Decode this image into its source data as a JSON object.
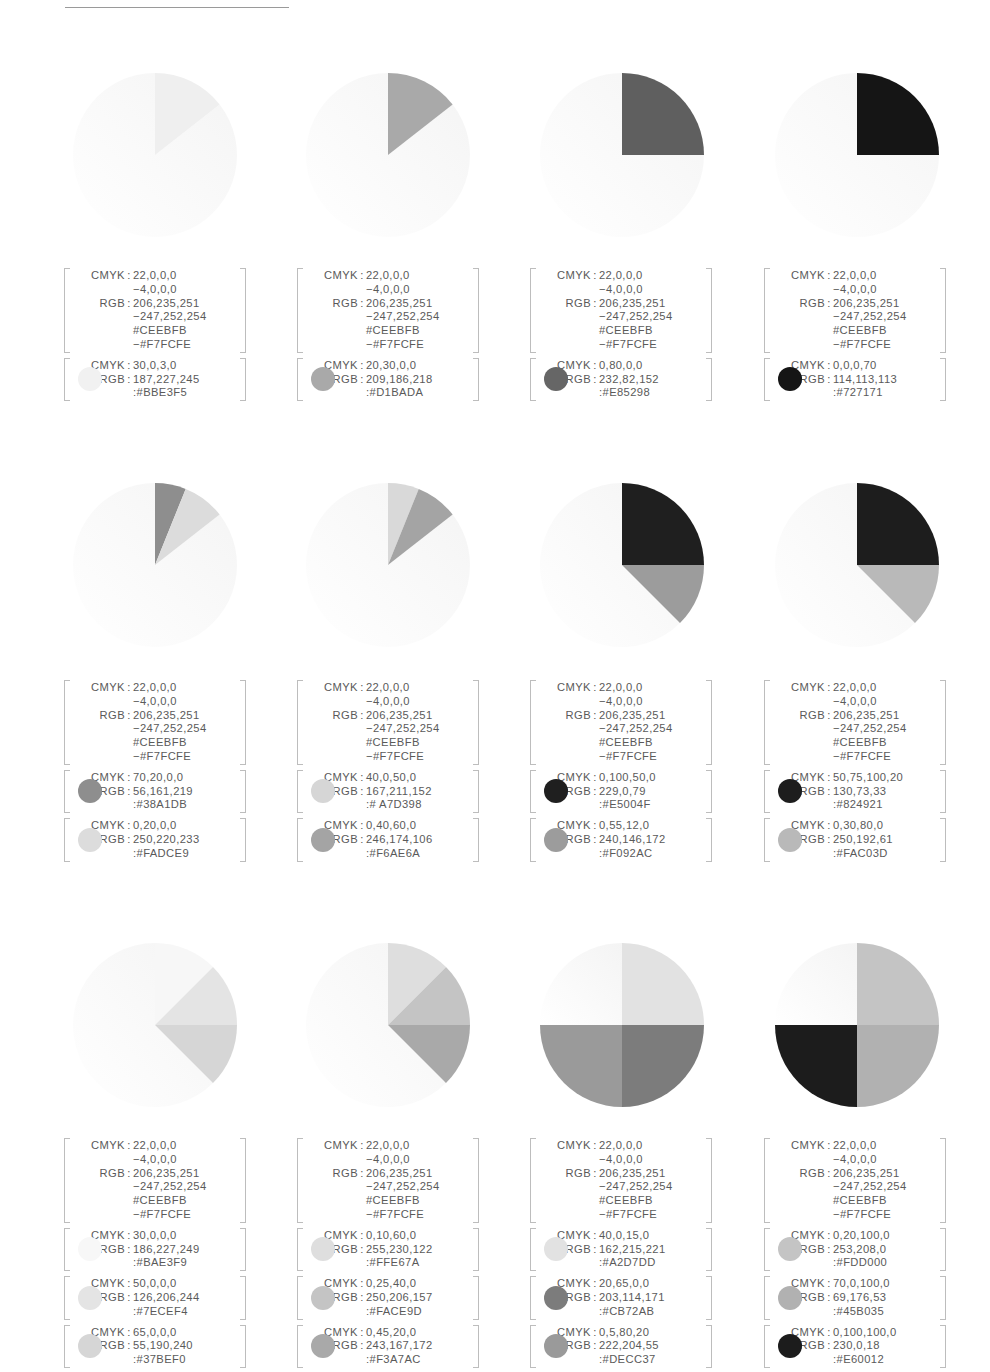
{
  "labels": {
    "cmyk": "CMYK",
    "rgb": "RGB",
    "sep": ":"
  },
  "base": {
    "cmyk_1": "22,0,0,0",
    "cmyk_2": "−4,0,0,0",
    "rgb_1": "206,235,251",
    "rgb_2": "−247,252,254",
    "hex_1": "#CEEBFB",
    "hex_2": "−#F7FCFE",
    "gradient": [
      "#CEEBFB",
      "#F7FCFE"
    ]
  },
  "cards": [
    {
      "swatches": [
        {
          "cmyk": "30,0,3,0",
          "rgb": "187,227,245",
          "hex": ":#BBE3F5",
          "color": "#BBE3F5",
          "gray": "#f1f1f1"
        }
      ]
    },
    {
      "swatches": [
        {
          "cmyk": "20,30,0,0",
          "rgb": "209,186,218",
          "hex": ":#D1BADA",
          "color": "#D1BADA",
          "gray": "#a9a9a9"
        }
      ]
    },
    {
      "swatches": [
        {
          "cmyk": "0,80,0,0",
          "rgb": "232,82,152",
          "hex": ":#E85298",
          "color": "#E85298",
          "gray": "#666666"
        }
      ]
    },
    {
      "swatches": [
        {
          "cmyk": "0,0,0,70",
          "rgb": "114,113,113",
          "hex": ":#727171",
          "color": "#727171",
          "gray": "#151515"
        }
      ]
    },
    {
      "swatches": [
        {
          "cmyk": "70,20,0,0",
          "rgb": "56,161,219",
          "hex": ":#38A1DB",
          "color": "#38A1DB",
          "gray": "#8e8e8e"
        },
        {
          "cmyk": "0,20,0,0",
          "rgb": "250,220,233",
          "hex": ":#FADCE9",
          "color": "#FADCE9",
          "gray": "#dcdcdc"
        }
      ]
    },
    {
      "swatches": [
        {
          "cmyk": "40,0,50,0",
          "rgb": "167,211,152",
          "hex": ":# A7D398",
          "color": "#A7D398",
          "gray": "#d6d6d6"
        },
        {
          "cmyk": "0,40,60,0",
          "rgb": "246,174,106",
          "hex": ":#F6AE6A",
          "color": "#F6AE6A",
          "gray": "#a4a4a4"
        }
      ]
    },
    {
      "swatches": [
        {
          "cmyk": "0,100,50,0",
          "rgb": "229,0,79",
          "hex": ":#E5004F",
          "color": "#E5004F",
          "gray": "#1f1f1f"
        },
        {
          "cmyk": "0,55,12,0",
          "rgb": "240,146,172",
          "hex": ":#F092AC",
          "color": "#F092AC",
          "gray": "#9c9c9c"
        }
      ]
    },
    {
      "swatches": [
        {
          "cmyk": "50,75,100,20",
          "rgb": "130,73,33",
          "hex": ":#824921",
          "color": "#824921",
          "gray": "#1d1d1d"
        },
        {
          "cmyk": "0,30,80,0",
          "rgb": "250,192,61",
          "hex": ":#FAC03D",
          "color": "#FAC03D",
          "gray": "#b9b9b9"
        }
      ]
    },
    {
      "swatches": [
        {
          "cmyk": "30,0,0,0",
          "rgb": "186,227,249",
          "hex": ":#BAE3F9",
          "color": "#BAE3F9",
          "gray": "#f7f7f7"
        },
        {
          "cmyk": "50,0,0,0",
          "rgb": "126,206,244",
          "hex": ":#7ECEF4",
          "color": "#7ECEF4",
          "gray": "#e4e4e4"
        },
        {
          "cmyk": "65,0,0,0",
          "rgb": "55,190,240",
          "hex": ":#37BEF0",
          "color": "#37BEF0",
          "gray": "#d6d6d6"
        }
      ]
    },
    {
      "swatches": [
        {
          "cmyk": "0,10,60,0",
          "rgb": "255,230,122",
          "hex": ":#FFE67A",
          "color": "#FFE67A",
          "gray": "#dedede"
        },
        {
          "cmyk": "0,25,40,0",
          "rgb": "250,206,157",
          "hex": ":#FACE9D",
          "color": "#FACE9D",
          "gray": "#c4c4c4"
        },
        {
          "cmyk": "0,45,20,0",
          "rgb": "243,167,172",
          "hex": ":#F3A7AC",
          "color": "#F3A7AC",
          "gray": "#a9a9a9"
        }
      ]
    },
    {
      "swatches": [
        {
          "cmyk": "40,0,15,0",
          "rgb": "162,215,221",
          "hex": ":#A2D7DD",
          "color": "#A2D7DD",
          "gray": "#e2e2e2"
        },
        {
          "cmyk": "20,65,0,0",
          "rgb": "203,114,171",
          "hex": ":#CB72AB",
          "color": "#CB72AB",
          "gray": "#7c7c7c"
        },
        {
          "cmyk": "0,5,80,20",
          "rgb": "222,204,55",
          "hex": ":#DECC37",
          "color": "#DECC37",
          "gray": "#9a9a9a"
        }
      ]
    },
    {
      "swatches": [
        {
          "cmyk": "0,20,100,0",
          "rgb": "253,208,0",
          "hex": ":#FDD000",
          "color": "#FDD000",
          "gray": "#c4c4c4"
        },
        {
          "cmyk": "70,0,100,0",
          "rgb": "69,176,53",
          "hex": ":#45B035",
          "color": "#45B035",
          "gray": "#b1b1b1"
        },
        {
          "cmyk": "0,100,100,0",
          "rgb": "230,0,18",
          "hex": ":#E60012",
          "color": "#E60012",
          "gray": "#1c1c1c"
        }
      ]
    }
  ],
  "chart_data": [
    {
      "type": "pie",
      "title": "",
      "slices_deg": [
        [
          0,
          52
        ]
      ],
      "colors": [
        "#BBE3F5"
      ],
      "remainder": "gradient #CEEBFB→#F7FCFE"
    },
    {
      "type": "pie",
      "title": "",
      "slices_deg": [
        [
          0,
          52
        ]
      ],
      "colors": [
        "#D1BADA"
      ],
      "remainder": "gradient #CEEBFB→#F7FCFE"
    },
    {
      "type": "pie",
      "title": "",
      "slices_deg": [
        [
          0,
          90
        ]
      ],
      "colors": [
        "#E85298"
      ],
      "remainder": "gradient #CEEBFB→#F7FCFE"
    },
    {
      "type": "pie",
      "title": "",
      "slices_deg": [
        [
          0,
          90
        ]
      ],
      "colors": [
        "#727171"
      ],
      "remainder": "gradient #CEEBFB→#F7FCFE"
    },
    {
      "type": "pie",
      "title": "",
      "slices_deg": [
        [
          0,
          22
        ],
        [
          22,
          52
        ]
      ],
      "colors": [
        "#38A1DB",
        "#FADCE9"
      ],
      "remainder": "gradient #CEEBFB→#F7FCFE"
    },
    {
      "type": "pie",
      "title": "",
      "slices_deg": [
        [
          0,
          22
        ],
        [
          22,
          52
        ]
      ],
      "colors": [
        "#A7D398",
        "#F6AE6A"
      ],
      "remainder": "gradient #CEEBFB→#F7FCFE"
    },
    {
      "type": "pie",
      "title": "",
      "slices_deg": [
        [
          0,
          90
        ],
        [
          90,
          135
        ]
      ],
      "colors": [
        "#E5004F",
        "#F092AC"
      ],
      "remainder": "gradient #CEEBFB→#F7FCFE"
    },
    {
      "type": "pie",
      "title": "",
      "slices_deg": [
        [
          0,
          90
        ],
        [
          90,
          135
        ]
      ],
      "colors": [
        "#824921",
        "#FAC03D"
      ],
      "remainder": "gradient #CEEBFB→#F7FCFE"
    },
    {
      "type": "pie",
      "title": "",
      "slices_deg": [
        [
          0,
          45
        ],
        [
          45,
          90
        ],
        [
          90,
          135
        ]
      ],
      "colors": [
        "#BAE3F9",
        "#7ECEF4",
        "#37BEF0"
      ],
      "remainder": "gradient #CEEBFB→#F7FCFE"
    },
    {
      "type": "pie",
      "title": "",
      "slices_deg": [
        [
          0,
          45
        ],
        [
          45,
          90
        ],
        [
          90,
          135
        ]
      ],
      "colors": [
        "#FFE67A",
        "#FACE9D",
        "#F3A7AC"
      ],
      "remainder": "gradient #CEEBFB→#F7FCFE"
    },
    {
      "type": "pie",
      "title": "",
      "slices_deg": [
        [
          0,
          90
        ],
        [
          90,
          180
        ],
        [
          180,
          270
        ]
      ],
      "colors": [
        "#A2D7DD",
        "#CB72AB",
        "#DECC37"
      ],
      "remainder": "gradient #CEEBFB→#F7FCFE"
    },
    {
      "type": "pie",
      "title": "",
      "slices_deg": [
        [
          0,
          90
        ],
        [
          90,
          180
        ],
        [
          180,
          270
        ]
      ],
      "colors": [
        "#FDD000",
        "#45B035",
        "#E60012"
      ],
      "remainder": "gradient #CEEBFB→#F7FCFE"
    }
  ],
  "layout": {
    "col_x": [
      155,
      388,
      622,
      857
    ],
    "pie_cy": [
      155,
      565,
      1025
    ],
    "radius": 82,
    "card_left": [
      64,
      297,
      530,
      764
    ],
    "card_top": [
      268,
      680,
      1138
    ],
    "pie_gray": [
      [
        "#efefef"
      ],
      [
        "#a9a9a9"
      ],
      [
        "#5f5f5f"
      ],
      [
        "#151515"
      ],
      [
        "#8e8e8e",
        "#dcdcdc"
      ],
      [
        "#d9d9d9",
        "#a4a4a4"
      ],
      [
        "#1f1f1f",
        "#9c9c9c"
      ],
      [
        "#1d1d1d",
        "#b9b9b9"
      ],
      [
        "#f7f7f7",
        "#e4e4e4",
        "#d6d6d6"
      ],
      [
        "#dedede",
        "#c4c4c4",
        "#a9a9a9"
      ],
      [
        "#e2e2e2",
        "#7c7c7c",
        "#9a9a9a"
      ],
      [
        "#c4c4c4",
        "#b1b1b1",
        "#1c1c1c"
      ]
    ]
  }
}
